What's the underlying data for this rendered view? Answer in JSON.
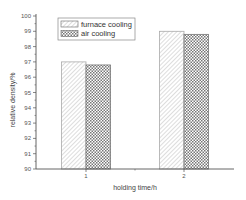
{
  "chart_data": {
    "type": "bar",
    "title": "",
    "xlabel": "holding time/h",
    "ylabel": "relative density/%",
    "categories": [
      "1",
      "2"
    ],
    "series": [
      {
        "name": "furnace cooling",
        "values": [
          97.0,
          99.0
        ],
        "pattern": "diagonal-hatch"
      },
      {
        "name": "air cooling",
        "values": [
          96.8,
          98.8
        ],
        "pattern": "crosshatch"
      }
    ],
    "ylim": [
      90,
      100
    ],
    "yticks": [
      "90",
      "91",
      "92",
      "93",
      "94",
      "95",
      "96",
      "97",
      "98",
      "99",
      "100"
    ],
    "grid": false,
    "legend_position": "upper-left"
  }
}
